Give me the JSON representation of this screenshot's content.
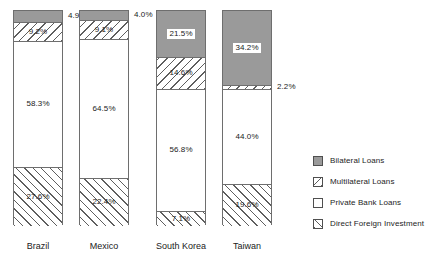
{
  "chart_data": {
    "type": "bar",
    "title": "",
    "subtitle": "",
    "xlabel": "",
    "ylabel": "",
    "ylim": [
      0,
      100
    ],
    "stacked": true,
    "stack_mode": "percent",
    "grid": false,
    "legend_position": "right",
    "categories": [
      "Brazil",
      "Mexico",
      "South Korea",
      "Taiwan"
    ],
    "series": [
      {
        "name": "Bilateral Loans",
        "pattern": "solid-gray",
        "color": "#9a9a9a",
        "values": [
          4.9,
          4.0,
          21.5,
          34.2
        ],
        "labels": [
          "4.9%",
          "4.0%",
          "21.5%",
          "34.2%"
        ]
      },
      {
        "name": "Multilateral Loans",
        "pattern": "backslash-hatch",
        "color": "#ffffff",
        "values": [
          9.2,
          9.1,
          14.6,
          2.2
        ],
        "labels": [
          "9.2%",
          "9.1%",
          "14.6%",
          "2.2%"
        ]
      },
      {
        "name": "Private Bank Loans",
        "pattern": "white",
        "color": "#ffffff",
        "values": [
          58.3,
          64.5,
          56.8,
          44.0
        ],
        "labels": [
          "58.3%",
          "64.5%",
          "56.8%",
          "44.0%"
        ]
      },
      {
        "name": "Direct Foreign Investment",
        "pattern": "forwardslash-hatch",
        "color": "#ffffff",
        "values": [
          27.6,
          22.4,
          7.1,
          19.6
        ],
        "labels": [
          "27.6%",
          "22.4%",
          "7.1%",
          "19.6%"
        ]
      }
    ]
  },
  "legend": {
    "items": [
      {
        "label": "Bilateral Loans"
      },
      {
        "label": "Multilateral Loans"
      },
      {
        "label": "Private Bank Loans"
      },
      {
        "label": "Direct Foreign Investment"
      }
    ]
  }
}
